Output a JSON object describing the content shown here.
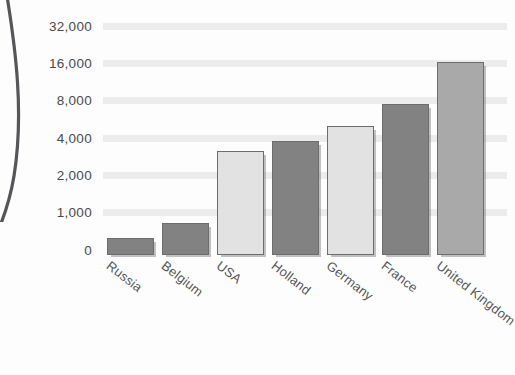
{
  "chart_data": {
    "type": "bar",
    "title": "",
    "subtitle": "",
    "xlabel": "",
    "ylabel": "",
    "categories": [
      "Russia",
      "Belgium",
      "USA",
      "Holland",
      "Germany",
      "France",
      "United Kingdom"
    ],
    "values": [
      450,
      850,
      3400,
      4100,
      5500,
      8200,
      18000
    ],
    "y_ticks": [
      0,
      1000,
      2000,
      4000,
      8000,
      16000,
      32000
    ],
    "y_tick_labels": [
      "0",
      "1,000",
      "2,000",
      "4,000",
      "8,000",
      "16,000",
      "32,000"
    ],
    "ylim": [
      0,
      32000
    ],
    "scale": "log2",
    "grid": true,
    "legend": "none",
    "bar_shades": [
      "dark",
      "dark",
      "light",
      "dark",
      "light",
      "dark",
      "medium"
    ],
    "series": [
      {
        "name": "",
        "values": [
          450,
          850,
          3400,
          4100,
          5500,
          8200,
          18000
        ]
      }
    ]
  },
  "style": {
    "background": "#fdfdfd",
    "grid_color": "#ececec",
    "bar_dark": "#828282",
    "bar_light": "#e2e2e2",
    "bar_medium": "#a9a9a9",
    "bar_outline": "#6d6d6d",
    "text_color": "#4a4a4a"
  }
}
